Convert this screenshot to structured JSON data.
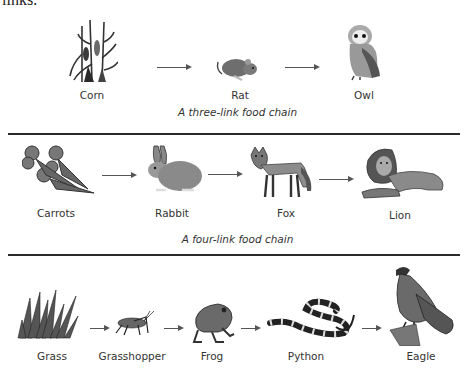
{
  "header_fragment": "links:",
  "chains": [
    {
      "caption": "A three-link food chain",
      "organisms": [
        {
          "name": "Corn",
          "icon": "corn-icon"
        },
        {
          "name": "Rat",
          "icon": "rat-icon"
        },
        {
          "name": "Owl",
          "icon": "owl-icon"
        }
      ]
    },
    {
      "caption": "A four-link food chain",
      "organisms": [
        {
          "name": "Carrots",
          "icon": "carrots-icon"
        },
        {
          "name": "Rabbit",
          "icon": "rabbit-icon"
        },
        {
          "name": "Fox",
          "icon": "fox-icon"
        },
        {
          "name": "Lion",
          "icon": "lion-icon"
        }
      ]
    },
    {
      "caption": "",
      "organisms": [
        {
          "name": "Grass",
          "icon": "grass-icon"
        },
        {
          "name": "Grasshopper",
          "icon": "grasshopper-icon"
        },
        {
          "name": "Frog",
          "icon": "frog-icon"
        },
        {
          "name": "Python",
          "icon": "python-icon"
        },
        {
          "name": "Eagle",
          "icon": "eagle-icon"
        }
      ]
    }
  ],
  "colors": {
    "ink": "#2b2b2b",
    "arrow": "#555555",
    "fill_dark": "#4a4a4a",
    "fill_mid": "#8a8a8a",
    "fill_light": "#c8c8c8"
  }
}
